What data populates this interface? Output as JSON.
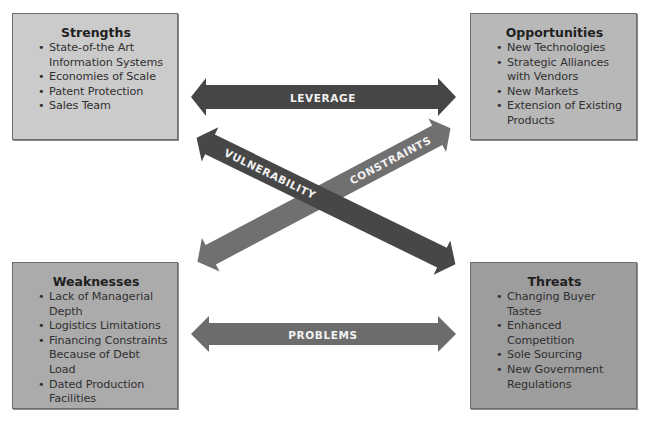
{
  "quadrants": {
    "strengths": {
      "title": "Strengths",
      "items": [
        "State-of-the Art Information Systems",
        "Economies of Scale",
        "Patent Protection",
        "Sales Team"
      ],
      "color": "#cbcbcb"
    },
    "opportunities": {
      "title": "Opportunities",
      "items": [
        "New Technologies",
        "Strategic Alliances with Vendors",
        "New Markets",
        "Extension of Existing Products"
      ],
      "color": "#b8b8b8"
    },
    "weaknesses": {
      "title": "Weaknesses",
      "items": [
        "Lack of Managerial Depth",
        "Logistics Limitations",
        "Financing Constraints Because of Debt Load",
        "Dated Production Facilities"
      ],
      "color": "#ababab"
    },
    "threats": {
      "title": "Threats",
      "items": [
        "Changing Buyer Tastes",
        "Enhanced Competition",
        "Sole Sourcing",
        "New Government Regulations"
      ],
      "color": "#9d9d9d"
    }
  },
  "arrows": {
    "leverage": {
      "label": "LEVERAGE",
      "from": "Strengths",
      "to": "Opportunities",
      "color": "#464646"
    },
    "problems": {
      "label": "PROBLEMS",
      "from": "Weaknesses",
      "to": "Threats",
      "color": "#6c6c6c"
    },
    "vulnerability": {
      "label": "VULNERABILITY",
      "from": "Strengths",
      "to": "Threats",
      "color": "#474747"
    },
    "constraints": {
      "label": "CONSTRAINTS",
      "from": "Weaknesses",
      "to": "Opportunities",
      "color": "#707070"
    }
  }
}
